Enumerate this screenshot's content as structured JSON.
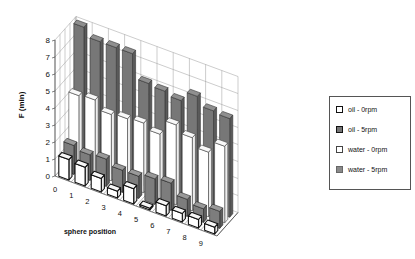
{
  "chart_data": {
    "type": "bar",
    "subtype": "3d-clustered-depth",
    "title": "",
    "xlabel": "sphere position",
    "ylabel": "F (min)",
    "ylim": [
      0,
      8
    ],
    "yticks": [
      "0",
      "1",
      "2",
      "3",
      "4",
      "5",
      "6",
      "7",
      "8"
    ],
    "grid": true,
    "legend_position": "right",
    "categories": [
      "0",
      "1",
      "2",
      "3",
      "4",
      "5",
      "6",
      "7",
      "8",
      "9"
    ],
    "series": [
      {
        "name": "oil - 0rpm",
        "color": "#ffffff",
        "values": [
          1.2,
          1.1,
          0.8,
          0.4,
          0.9,
          0.1,
          0.6,
          0.5,
          0.5,
          0.4
        ]
      },
      {
        "name": "oil - 5rpm",
        "color": "#7a7a7a",
        "values": [
          1.7,
          1.5,
          1.6,
          1.3,
          1.3,
          1.5,
          1.6,
          1.0,
          0.8,
          1.0
        ]
      },
      {
        "name": "water - 0rpm",
        "color": "#ffffff",
        "values": [
          4.3,
          4.4,
          3.9,
          4.0,
          4.1,
          3.8,
          4.7,
          4.3,
          3.8,
          4.5
        ]
      },
      {
        "name": "water - 5rpm",
        "color": "#6e6e6e",
        "values": [
          8.0,
          7.5,
          7.5,
          7.5,
          6.1,
          6.0,
          5.8,
          6.4,
          5.9,
          5.8
        ]
      }
    ]
  },
  "legend": {
    "items": [
      {
        "label": "oil - 0rpm",
        "fill": "#ffffff"
      },
      {
        "label": "oil - 5rpm",
        "fill": "#777777"
      },
      {
        "label": "water - 0rpm",
        "fill": "#ffffff"
      },
      {
        "label": "water - 5rpm",
        "fill": "#8a8a8a"
      }
    ]
  }
}
